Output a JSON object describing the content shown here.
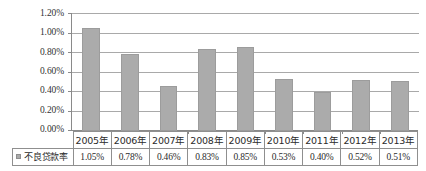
{
  "chart_data": {
    "type": "bar",
    "title": "",
    "xlabel": "",
    "ylabel": "",
    "categories": [
      "2005年",
      "2006年",
      "2007年",
      "2008年",
      "2009年",
      "2010年",
      "2011年",
      "2012年",
      "2013年"
    ],
    "series": [
      {
        "name": "不良贷款率",
        "values": [
          1.05,
          0.78,
          0.46,
          0.83,
          0.85,
          0.53,
          0.4,
          0.52,
          0.51
        ],
        "value_labels": [
          "1.05%",
          "0.78%",
          "0.46%",
          "0.83%",
          "0.85%",
          "0.53%",
          "0.40%",
          "0.52%",
          "0.51%"
        ],
        "color": "#ababab"
      }
    ],
    "ylim": [
      0,
      1.2
    ],
    "ytick_values": [
      1.2,
      1.0,
      0.8,
      0.6,
      0.4,
      0.2,
      0.0
    ],
    "ytick_labels": [
      "1.20%",
      "1.00%",
      "0.80%",
      "0.60%",
      "0.40%",
      "0.20%",
      "0.00%"
    ],
    "grid": true,
    "legend_position": "data-table-left"
  },
  "legend": {
    "marker_icon": "legend-square-icon",
    "label": "不良贷款率"
  },
  "colors": {
    "bar": "#ababab",
    "bar_border": "#9c9c9c",
    "gridline": "#a9a9a9",
    "axis": "#8a8a8a",
    "table_border": "#8f8f8f",
    "background": "#ffffff",
    "text": "#2b2b2b"
  }
}
